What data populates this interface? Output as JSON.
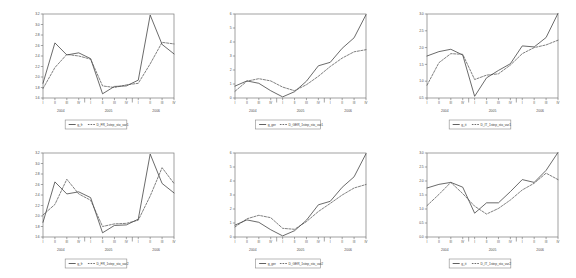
{
  "figure": {
    "panel_count": 6,
    "columns": 3,
    "rows": 2,
    "x_quarter_ticks": [
      "I",
      "II",
      "III",
      "IV",
      "I",
      "II",
      "III",
      "IV",
      "I",
      "II",
      "III",
      "IV"
    ],
    "years": [
      "2004",
      "2005",
      "2006"
    ],
    "colors": {
      "solid_series": "#3a3a3a",
      "dashed_series": "#4a4a4a",
      "axis": "#6a6a6a",
      "background": "#ffffff"
    }
  },
  "chart_data": [
    {
      "id": "panel-top-left",
      "type": "line",
      "title": "",
      "xlabel": "",
      "ylabel": "",
      "ylim": [
        1.6,
        3.2
      ],
      "yticks": [
        "1.6",
        "1.8",
        "2.0",
        "2.2",
        "2.4",
        "2.6",
        "2.8",
        "3.0",
        "3.2"
      ],
      "grid": false,
      "legend_position": "below",
      "categories": [
        "2004 I",
        "2004 II",
        "2004 III",
        "2004 IV",
        "2005 I",
        "2005 II",
        "2005 III",
        "2005 IV",
        "2006 I",
        "2006 II",
        "2006 III",
        "2006 IV"
      ],
      "series": [
        {
          "name": "g_fr",
          "style": "solid",
          "values": [
            1.88,
            2.65,
            2.42,
            2.46,
            2.35,
            1.68,
            1.82,
            1.83,
            1.94,
            3.18,
            2.62,
            2.44
          ]
        },
        {
          "name": "D_FR_1step_sto_var1",
          "style": "dashed",
          "values": [
            1.78,
            2.18,
            2.43,
            2.4,
            2.34,
            1.83,
            1.8,
            1.85,
            1.88,
            2.25,
            2.66,
            2.63
          ]
        }
      ]
    },
    {
      "id": "panel-top-middle",
      "type": "line",
      "title": "",
      "xlabel": "",
      "ylabel": "",
      "ylim": [
        0,
        6
      ],
      "yticks": [
        "0",
        "1",
        "2",
        "3",
        "4",
        "5",
        "6"
      ],
      "grid": false,
      "legend_position": "below",
      "categories": [
        "2004 I",
        "2004 II",
        "2004 III",
        "2004 IV",
        "2005 I",
        "2005 II",
        "2005 III",
        "2005 IV",
        "2006 I",
        "2006 II",
        "2006 III",
        "2006 IV"
      ],
      "series": [
        {
          "name": "g_ger",
          "style": "solid",
          "values": [
            0.85,
            1.22,
            1.05,
            0.52,
            0.08,
            0.45,
            1.2,
            2.3,
            2.55,
            3.55,
            4.3,
            5.95
          ]
        },
        {
          "name": "D_GER_1step_sto_var1",
          "style": "dashed",
          "values": [
            0.48,
            1.2,
            1.38,
            1.22,
            0.78,
            0.52,
            0.95,
            1.55,
            2.25,
            2.85,
            3.3,
            3.45
          ]
        }
      ]
    },
    {
      "id": "panel-top-right",
      "type": "line",
      "title": "",
      "xlabel": "",
      "ylabel": "",
      "ylim": [
        0.5,
        3.0
      ],
      "yticks": [
        "0.5",
        "1.0",
        "1.5",
        "2.0",
        "2.5",
        "3.0"
      ],
      "grid": false,
      "legend_position": "below",
      "categories": [
        "2004 I",
        "2004 II",
        "2004 III",
        "2004 IV",
        "2005 I",
        "2005 II",
        "2005 III",
        "2005 IV",
        "2006 I",
        "2006 II",
        "2006 III",
        "2006 IV"
      ],
      "series": [
        {
          "name": "g_it",
          "style": "solid",
          "values": [
            1.75,
            1.88,
            1.95,
            1.78,
            0.55,
            1.1,
            1.32,
            1.52,
            2.05,
            2.02,
            2.3,
            3.02
          ]
        },
        {
          "name": "D_IT_1step_sto_var1",
          "style": "dashed",
          "values": [
            0.88,
            1.55,
            1.82,
            1.8,
            1.05,
            1.18,
            1.22,
            1.48,
            1.82,
            2.0,
            2.08,
            2.22
          ]
        }
      ]
    },
    {
      "id": "panel-bottom-left",
      "type": "line",
      "title": "",
      "xlabel": "",
      "ylabel": "",
      "ylim": [
        1.6,
        3.2
      ],
      "yticks": [
        "1.6",
        "1.8",
        "2.0",
        "2.2",
        "2.4",
        "2.6",
        "2.8",
        "3.0",
        "3.2"
      ],
      "grid": false,
      "legend_position": "below",
      "categories": [
        "2004 I",
        "2004 II",
        "2004 III",
        "2004 IV",
        "2005 I",
        "2005 II",
        "2005 III",
        "2005 IV",
        "2006 I",
        "2006 II",
        "2006 III",
        "2006 IV"
      ],
      "series": [
        {
          "name": "g_fr",
          "style": "solid",
          "values": [
            1.88,
            2.65,
            2.42,
            2.46,
            2.35,
            1.68,
            1.82,
            1.83,
            1.94,
            3.18,
            2.62,
            2.44
          ]
        },
        {
          "name": "D_FR_1step_sto_var2",
          "style": "dashed",
          "values": [
            2.02,
            2.22,
            2.7,
            2.42,
            2.3,
            1.8,
            1.85,
            1.86,
            1.92,
            2.38,
            2.92,
            2.62
          ]
        }
      ]
    },
    {
      "id": "panel-bottom-middle",
      "type": "line",
      "title": "",
      "xlabel": "",
      "ylabel": "",
      "ylim": [
        0,
        6
      ],
      "yticks": [
        "0",
        "1",
        "2",
        "3",
        "4",
        "5",
        "6"
      ],
      "grid": false,
      "legend_position": "below",
      "categories": [
        "2004 I",
        "2004 II",
        "2004 III",
        "2004 IV",
        "2005 I",
        "2005 II",
        "2005 III",
        "2005 IV",
        "2006 I",
        "2006 II",
        "2006 III",
        "2006 IV"
      ],
      "series": [
        {
          "name": "g_ger",
          "style": "solid",
          "values": [
            0.85,
            1.22,
            1.05,
            0.52,
            0.08,
            0.45,
            1.2,
            2.3,
            2.55,
            3.55,
            4.3,
            5.95
          ]
        },
        {
          "name": "D_GER_1step_sto_var2",
          "style": "dashed",
          "values": [
            0.72,
            1.3,
            1.55,
            1.38,
            0.62,
            0.55,
            1.1,
            1.82,
            2.4,
            3.0,
            3.5,
            3.75
          ]
        }
      ]
    },
    {
      "id": "panel-bottom-right",
      "type": "line",
      "title": "",
      "xlabel": "",
      "ylabel": "",
      "ylim": [
        0.0,
        3.0
      ],
      "yticks": [
        "0.0",
        "0.5",
        "1.0",
        "1.5",
        "2.0",
        "2.5",
        "3.0"
      ],
      "grid": false,
      "legend_position": "below",
      "categories": [
        "2004 I",
        "2004 II",
        "2004 III",
        "2004 IV",
        "2005 I",
        "2005 II",
        "2005 III",
        "2005 IV",
        "2006 I",
        "2006 II",
        "2006 III",
        "2006 IV"
      ],
      "series": [
        {
          "name": "g_it",
          "style": "solid",
          "values": [
            1.75,
            1.88,
            1.95,
            1.78,
            0.85,
            1.22,
            1.22,
            1.62,
            2.05,
            1.95,
            2.38,
            3.02
          ]
        },
        {
          "name": "D_IT_1step_sto_var2",
          "style": "dashed",
          "values": [
            1.12,
            1.52,
            1.95,
            1.55,
            1.1,
            0.82,
            1.02,
            1.32,
            1.68,
            1.92,
            2.28,
            2.05
          ]
        }
      ]
    }
  ]
}
